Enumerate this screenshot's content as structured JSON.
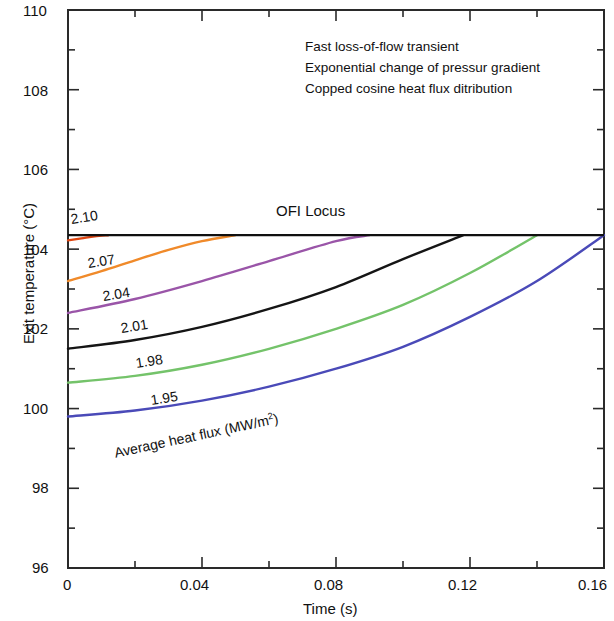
{
  "axes": {
    "x_title": "Time (s)",
    "y_title": "Exit temperature (°C)",
    "x_ticks": [
      "0",
      "0.04",
      "0.08",
      "0.12",
      "0.16"
    ],
    "y_ticks": [
      "96",
      "98",
      "100",
      "102",
      "104",
      "106",
      "108",
      "110"
    ]
  },
  "annotations": {
    "line1": "Fast loss-of-flow transient",
    "line2": "Exponential change of pressur gradient",
    "line3": "Copped cosine heat flux ditribution",
    "ofi": "OFI Locus",
    "flux_legend_pre": "Average heat flux (MW/m",
    "flux_legend_sup": "2",
    "flux_legend_post": ")"
  },
  "curve_labels": {
    "c210": "2.10",
    "c207": "2.07",
    "c204": "2.04",
    "c201": "2.01",
    "c198": "1.98",
    "c195": "1.95"
  },
  "colors": {
    "c210": "#e04510",
    "c207": "#f08a2a",
    "c204": "#9a55a8",
    "c201": "#151515",
    "c198": "#74c36a",
    "c195": "#4a4ab8",
    "ofi": "#101010",
    "frame": "#2a2a2a"
  },
  "chart_data": {
    "type": "line",
    "title": "",
    "xlabel": "Time (s)",
    "ylabel": "Exit temperature (°C)",
    "xlim": [
      0,
      0.16
    ],
    "ylim": [
      96,
      110
    ],
    "xticks": [
      0,
      0.04,
      0.08,
      0.12,
      0.16
    ],
    "yticks": [
      96,
      98,
      100,
      102,
      104,
      106,
      108,
      110
    ],
    "xminor_step": 0.02,
    "yminor_step": 1,
    "grid": false,
    "legend": "inline-curve-labels",
    "reference_lines": [
      {
        "name": "OFI Locus",
        "orientation": "horizontal",
        "y": 104.35,
        "color": "#101010"
      }
    ],
    "series": [
      {
        "name": "2.10",
        "label": "2.10",
        "color": "#e04510",
        "x": [
          0,
          0.004,
          0.008,
          0.012
        ],
        "y": [
          104.22,
          104.27,
          104.32,
          104.35
        ],
        "terminates_at_ofi": 0.012
      },
      {
        "name": "2.07",
        "label": "2.07",
        "color": "#f08a2a",
        "x": [
          0,
          0.01,
          0.02,
          0.03,
          0.04,
          0.05
        ],
        "y": [
          103.2,
          103.45,
          103.72,
          103.98,
          104.2,
          104.35
        ],
        "terminates_at_ofi": 0.051
      },
      {
        "name": "2.04",
        "label": "2.04",
        "color": "#9a55a8",
        "x": [
          0,
          0.02,
          0.04,
          0.06,
          0.08,
          0.09
        ],
        "y": [
          102.4,
          102.75,
          103.2,
          103.7,
          104.2,
          104.35
        ],
        "terminates_at_ofi": 0.0905
      },
      {
        "name": "2.01",
        "label": "2.01",
        "color": "#151515",
        "x": [
          0,
          0.02,
          0.04,
          0.06,
          0.08,
          0.1,
          0.118
        ],
        "y": [
          101.5,
          101.72,
          102.05,
          102.5,
          103.05,
          103.75,
          104.35
        ],
        "terminates_at_ofi": 0.118
      },
      {
        "name": "1.98",
        "label": "1.98",
        "color": "#74c36a",
        "x": [
          0,
          0.02,
          0.04,
          0.06,
          0.08,
          0.1,
          0.12,
          0.14
        ],
        "y": [
          100.65,
          100.82,
          101.1,
          101.5,
          102.0,
          102.6,
          103.4,
          104.35
        ],
        "terminates_at_ofi": 0.1405
      },
      {
        "name": "1.95",
        "label": "1.95",
        "color": "#4a4ab8",
        "x": [
          0,
          0.02,
          0.04,
          0.06,
          0.08,
          0.1,
          0.12,
          0.14,
          0.16
        ],
        "y": [
          99.8,
          99.95,
          100.2,
          100.55,
          101.0,
          101.55,
          102.3,
          103.2,
          104.35
        ],
        "terminates_at_ofi": 0.16
      }
    ]
  }
}
